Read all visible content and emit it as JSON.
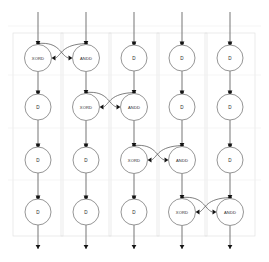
{
  "diagram": {
    "type": "circuit-schematic",
    "columns": 5,
    "rows": 4,
    "colors": {
      "node_stroke": "#8a8a8a",
      "node_fill": "#ffffff",
      "wire": "#6f6f6f",
      "curve": "#5e5e5e",
      "dot": "#141414",
      "background_box": "#e2e2e2",
      "grid": "#efefef",
      "label": "#2b2b2b",
      "page_background": "#ffffff"
    },
    "labels": {
      "xor": "XORD",
      "and": "ANDD",
      "delay": "D"
    },
    "geometry": {
      "column_x": [
        38,
        86,
        134,
        182,
        230
      ],
      "row_y": [
        58,
        107,
        160,
        212
      ],
      "node_radius_gate": 13.5,
      "node_radius_delay": 13.0,
      "top_input_y": 12,
      "bottom_output_y": 249,
      "junction_offset": 14.5,
      "box_top": 33,
      "box_bottom": 236,
      "box_left_pad": 25,
      "box_width": 50
    },
    "nodes": [
      {
        "id": "n-r0-c0",
        "row": 0,
        "col": 0,
        "label": "XORD",
        "kind": "gate-xor"
      },
      {
        "id": "n-r0-c1",
        "row": 0,
        "col": 1,
        "label": "ANDD",
        "kind": "gate-and"
      },
      {
        "id": "n-r0-c2",
        "row": 0,
        "col": 2,
        "label": "D",
        "kind": "delay"
      },
      {
        "id": "n-r0-c3",
        "row": 0,
        "col": 3,
        "label": "D",
        "kind": "delay"
      },
      {
        "id": "n-r0-c4",
        "row": 0,
        "col": 4,
        "label": "D",
        "kind": "delay"
      },
      {
        "id": "n-r1-c0",
        "row": 1,
        "col": 0,
        "label": "D",
        "kind": "delay"
      },
      {
        "id": "n-r1-c1",
        "row": 1,
        "col": 1,
        "label": "XORD",
        "kind": "gate-xor"
      },
      {
        "id": "n-r1-c2",
        "row": 1,
        "col": 2,
        "label": "ANDD",
        "kind": "gate-and"
      },
      {
        "id": "n-r1-c3",
        "row": 1,
        "col": 3,
        "label": "D",
        "kind": "delay"
      },
      {
        "id": "n-r1-c4",
        "row": 1,
        "col": 4,
        "label": "D",
        "kind": "delay"
      },
      {
        "id": "n-r2-c0",
        "row": 2,
        "col": 0,
        "label": "D",
        "kind": "delay"
      },
      {
        "id": "n-r2-c1",
        "row": 2,
        "col": 1,
        "label": "D",
        "kind": "delay"
      },
      {
        "id": "n-r2-c2",
        "row": 2,
        "col": 2,
        "label": "XORD",
        "kind": "gate-xor"
      },
      {
        "id": "n-r2-c3",
        "row": 2,
        "col": 3,
        "label": "ANDD",
        "kind": "gate-and"
      },
      {
        "id": "n-r2-c4",
        "row": 2,
        "col": 4,
        "label": "D",
        "kind": "delay"
      },
      {
        "id": "n-r3-c0",
        "row": 3,
        "col": 0,
        "label": "D",
        "kind": "delay"
      },
      {
        "id": "n-r3-c1",
        "row": 3,
        "col": 1,
        "label": "D",
        "kind": "delay"
      },
      {
        "id": "n-r3-c2",
        "row": 3,
        "col": 2,
        "label": "D",
        "kind": "delay"
      },
      {
        "id": "n-r3-c3",
        "row": 3,
        "col": 3,
        "label": "XORD",
        "kind": "gate-xor"
      },
      {
        "id": "n-r3-c4",
        "row": 3,
        "col": 4,
        "label": "ANDD",
        "kind": "gate-and"
      }
    ],
    "gate_pairs": [
      {
        "row": 0,
        "xor_col": 0,
        "and_col": 1
      },
      {
        "row": 1,
        "xor_col": 1,
        "and_col": 2
      },
      {
        "row": 2,
        "xor_col": 2,
        "and_col": 3
      },
      {
        "row": 3,
        "xor_col": 3,
        "and_col": 4
      }
    ]
  }
}
